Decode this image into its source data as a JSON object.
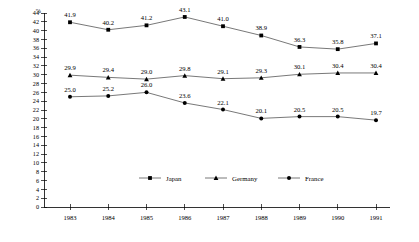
{
  "chart_data": {
    "type": "line",
    "title": "",
    "xlabel": "",
    "ylabel": "%",
    "ylim": [
      0,
      44
    ],
    "ytick_step": 2,
    "grid": false,
    "legend_position": "bottom-center",
    "categories": [
      "1983",
      "1984",
      "1985",
      "1986",
      "1987",
      "1988",
      "1989",
      "1990",
      "1991"
    ],
    "ytick_labels": [
      "44",
      "42",
      "40",
      "38",
      "36",
      "34",
      "32",
      "30",
      "28",
      "26",
      "24",
      "22",
      "20",
      "18",
      "16",
      "14",
      "12",
      "10",
      "8",
      "6",
      "4",
      "2",
      "0"
    ],
    "series": [
      {
        "name": "Japan",
        "marker": "square",
        "color": "#000000",
        "values": [
          41.9,
          40.2,
          41.2,
          43.1,
          41.0,
          38.9,
          36.3,
          35.8,
          37.1
        ],
        "labels": [
          "41.9",
          "40.2",
          "41.2",
          "43.1",
          "41.0",
          "38.9",
          "36.3",
          "35.8",
          "37.1"
        ]
      },
      {
        "name": "Germany",
        "marker": "triangle",
        "color": "#000000",
        "values": [
          29.9,
          29.4,
          29.0,
          29.8,
          29.1,
          29.3,
          30.1,
          30.4,
          30.4
        ],
        "labels": [
          "29.9",
          "29.4",
          "29.0",
          "29.8",
          "29.1",
          "29.3",
          "30.1",
          "30.4",
          "30.4"
        ]
      },
      {
        "name": "France",
        "marker": "circle",
        "color": "#000000",
        "values": [
          25.0,
          25.2,
          26.0,
          23.6,
          22.1,
          20.1,
          20.5,
          20.5,
          19.7
        ],
        "labels": [
          "25.0",
          "25.2",
          "26.0",
          "23.6",
          "22.1",
          "20.1",
          "20.5",
          "20.5",
          "19.7"
        ]
      }
    ]
  },
  "legend": {
    "items": [
      {
        "label": "Japan"
      },
      {
        "label": "Germany"
      },
      {
        "label": "France"
      }
    ]
  },
  "axes": {
    "y_unit": "%"
  }
}
